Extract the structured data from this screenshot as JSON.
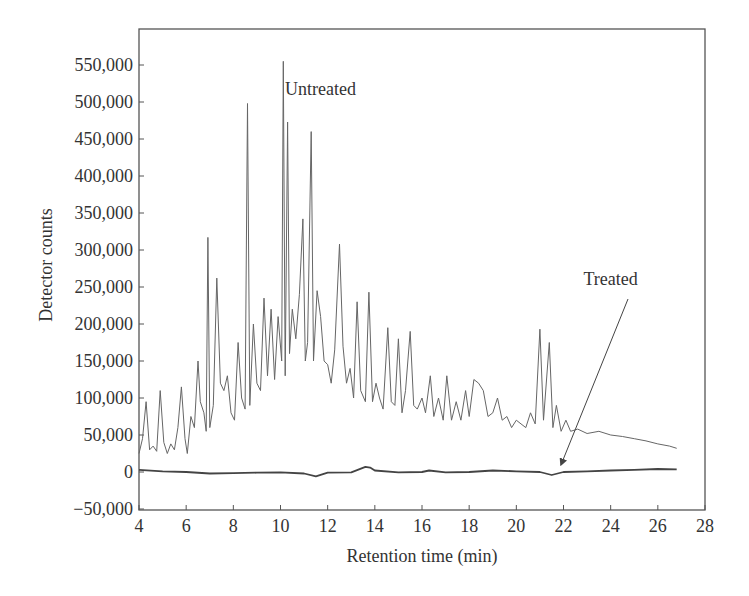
{
  "chart_data": {
    "type": "line",
    "title": "",
    "xlabel": "Retention time (min)",
    "ylabel": "Detector counts",
    "xlim": [
      4,
      28
    ],
    "ylim": [
      -50000,
      550000
    ],
    "grid": false,
    "legend": "none (inline annotations)",
    "x_ticks": [
      4,
      6,
      8,
      10,
      12,
      14,
      16,
      18,
      20,
      22,
      24,
      26,
      28
    ],
    "x_tick_labels": [
      "4",
      "6",
      "8",
      "10",
      "12",
      "14",
      "16",
      "18",
      "20",
      "22",
      "24",
      "26",
      "28"
    ],
    "y_ticks": [
      -50000,
      0,
      50000,
      100000,
      150000,
      200000,
      250000,
      300000,
      350000,
      400000,
      450000,
      500000,
      550000
    ],
    "y_tick_labels": [
      "−50,000",
      "0",
      "50,000",
      "100,000",
      "150,000",
      "200,000",
      "250,000",
      "300,000",
      "350,000",
      "400,000",
      "450,000",
      "500,000",
      "550,000"
    ],
    "annotations": [
      {
        "text": "Untreated",
        "x": 11.7,
        "y": 510000
      },
      {
        "text": "Treated",
        "x": 24.0,
        "y": 253000,
        "arrow_to": {
          "x": 21.9,
          "y": 2000
        }
      }
    ],
    "series": [
      {
        "name": "Untreated",
        "color": "#666666",
        "x": [
          4.0,
          4.15,
          4.3,
          4.45,
          4.6,
          4.75,
          4.9,
          5.05,
          5.2,
          5.35,
          5.5,
          5.65,
          5.8,
          5.95,
          6.05,
          6.2,
          6.35,
          6.5,
          6.6,
          6.75,
          6.85,
          6.92,
          7.0,
          7.15,
          7.3,
          7.45,
          7.6,
          7.75,
          7.9,
          8.05,
          8.2,
          8.35,
          8.5,
          8.6,
          8.7,
          8.85,
          9.0,
          9.15,
          9.3,
          9.45,
          9.6,
          9.75,
          9.9,
          10.05,
          10.12,
          10.2,
          10.3,
          10.38,
          10.5,
          10.65,
          10.8,
          10.95,
          11.05,
          11.15,
          11.3,
          11.4,
          11.55,
          11.7,
          11.85,
          12.0,
          12.15,
          12.3,
          12.5,
          12.65,
          12.8,
          12.95,
          13.1,
          13.25,
          13.4,
          13.6,
          13.75,
          13.9,
          14.05,
          14.2,
          14.35,
          14.55,
          14.7,
          14.85,
          15.0,
          15.15,
          15.3,
          15.5,
          15.65,
          15.8,
          16.0,
          16.15,
          16.35,
          16.5,
          16.7,
          16.9,
          17.05,
          17.25,
          17.45,
          17.65,
          17.85,
          18.0,
          18.2,
          18.4,
          18.6,
          18.8,
          19.0,
          19.2,
          19.4,
          19.6,
          19.8,
          20.0,
          20.2,
          20.4,
          20.6,
          20.8,
          21.0,
          21.15,
          21.4,
          21.55,
          21.7,
          21.9,
          22.1,
          22.3,
          22.6,
          23.0,
          23.5,
          24.0,
          24.5,
          25.0,
          25.5,
          26.0,
          26.5,
          26.8
        ],
        "values": [
          25000,
          45000,
          95000,
          30000,
          35000,
          28000,
          110000,
          40000,
          25000,
          38000,
          30000,
          60000,
          115000,
          45000,
          25000,
          75000,
          60000,
          150000,
          95000,
          80000,
          55000,
          317000,
          60000,
          90000,
          262000,
          120000,
          110000,
          130000,
          80000,
          70000,
          175000,
          100000,
          85000,
          498000,
          90000,
          200000,
          120000,
          110000,
          235000,
          130000,
          220000,
          125000,
          210000,
          150000,
          555000,
          130000,
          473000,
          160000,
          220000,
          180000,
          240000,
          342000,
          150000,
          175000,
          460000,
          150000,
          245000,
          210000,
          150000,
          145000,
          120000,
          165000,
          308000,
          170000,
          120000,
          140000,
          100000,
          230000,
          110000,
          95000,
          243000,
          95000,
          120000,
          100000,
          85000,
          195000,
          95000,
          90000,
          180000,
          80000,
          110000,
          190000,
          90000,
          85000,
          100000,
          80000,
          130000,
          75000,
          100000,
          70000,
          130000,
          70000,
          95000,
          70000,
          110000,
          75000,
          125000,
          120000,
          110000,
          75000,
          80000,
          100000,
          70000,
          75000,
          60000,
          70000,
          65000,
          60000,
          80000,
          65000,
          193000,
          70000,
          175000,
          60000,
          90000,
          55000,
          70000,
          55000,
          58000,
          52000,
          55000,
          50000,
          48000,
          45000,
          42000,
          38000,
          35000,
          32000
        ]
      },
      {
        "name": "Treated",
        "color": "#444444",
        "x": [
          4.0,
          5.0,
          6.0,
          7.0,
          8.0,
          9.0,
          10.0,
          11.0,
          11.5,
          12.0,
          13.0,
          13.6,
          13.8,
          14.0,
          15.0,
          16.0,
          16.3,
          17.0,
          18.0,
          19.0,
          20.0,
          21.0,
          21.5,
          22.0,
          23.0,
          24.0,
          25.0,
          26.0,
          26.8
        ],
        "values": [
          3000,
          1000,
          0,
          -2000,
          -1500,
          -1000,
          -500,
          -2000,
          -6000,
          -1000,
          -500,
          7000,
          6000,
          2000,
          -500,
          0,
          2000,
          -500,
          0,
          2000,
          1000,
          0,
          -4000,
          0,
          1000,
          2000,
          3000,
          4000,
          3500
        ]
      }
    ]
  }
}
